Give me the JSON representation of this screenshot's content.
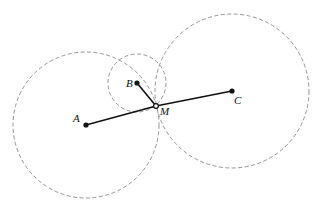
{
  "diagram": {
    "type": "geometry",
    "points": [
      {
        "id": "A",
        "label": "A",
        "x": 86,
        "y": 125,
        "style": "filled"
      },
      {
        "id": "B",
        "label": "B",
        "x": 137,
        "y": 83,
        "style": "filled"
      },
      {
        "id": "C",
        "label": "C",
        "x": 232,
        "y": 91,
        "style": "filled"
      },
      {
        "id": "M",
        "label": "M",
        "x": 156,
        "y": 106,
        "style": "hollow"
      }
    ],
    "segments": [
      {
        "from": "A",
        "to": "M"
      },
      {
        "from": "M",
        "to": "C"
      },
      {
        "from": "B",
        "to": "M"
      }
    ],
    "circles": [
      {
        "center": "A",
        "radius": 73,
        "style": "dashed"
      },
      {
        "center": "B",
        "radius": 29,
        "style": "dashed"
      },
      {
        "center": "C",
        "radius": 77,
        "style": "dashed"
      }
    ],
    "labels": {
      "A": "A",
      "B": "B",
      "C": "C",
      "M": "M"
    },
    "colors": {
      "line": "#111111",
      "circle": "#8a8a8a",
      "background": "#ffffff"
    }
  }
}
